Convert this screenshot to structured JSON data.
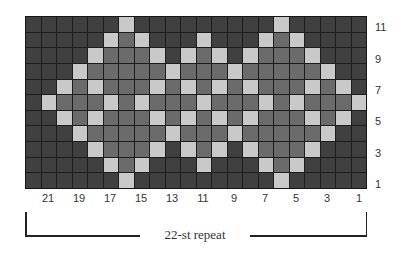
{
  "chart": {
    "columns": 22,
    "rows": 11,
    "legend_colors": {
      "D": "#404040",
      "M": "#6b6b6b",
      "L": "#c9c9c9"
    },
    "grid_rows_top_to_bottom": [
      "DDDDDDLDDDDDDDDDLDDDDD",
      "DDDDDLMLDDDLDDDLMLDDDD",
      "DDDDLMMMLDLMLDLMMMLDDD",
      "DDDLMMMMMLMMMLMMMMMLDD",
      "DDLMLMMMLMLMLMLMMMLMLD",
      "DLMMMLMLMMMLMMMLMLMMML",
      "DDLMLMMMLMLMLMLMMMLMLD",
      "DDDLMMMMMLMMMLMMMMMLDD",
      "DDDDLMMMLDLMLDLMMMLDDD",
      "DDDDDLMLDDDLDDDLMLDDDD",
      "DDDDDDLDDDDDDDDDLDDDDD"
    ]
  },
  "row_labels": [
    "11",
    "9",
    "7",
    "5",
    "3",
    "1"
  ],
  "column_labels": [
    "21",
    "19",
    "17",
    "15",
    "13",
    "11",
    "9",
    "7",
    "5",
    "3",
    "1"
  ],
  "repeat": {
    "label": "22-st repeat"
  }
}
